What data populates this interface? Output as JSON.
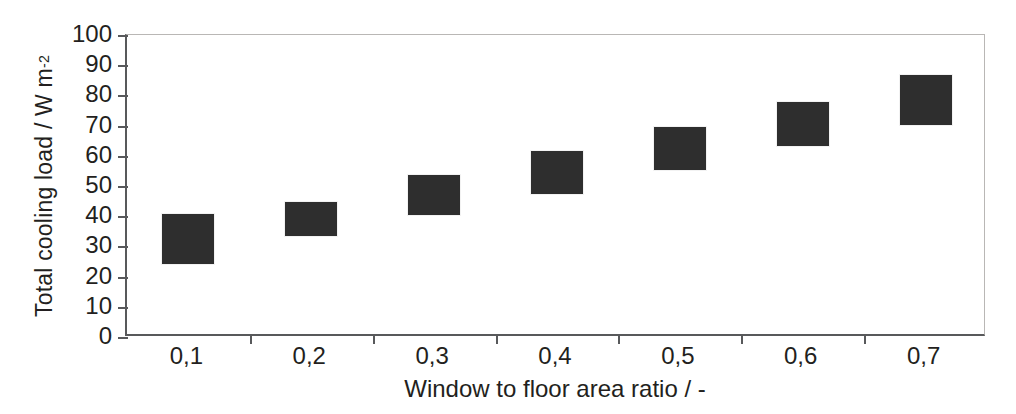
{
  "chart_data": {
    "type": "bar",
    "title": "",
    "xlabel": "Window to floor area ratio / -",
    "ylabel_text": "Total cooling load / W m",
    "ylabel_exponent": "-2",
    "ylabel_full": "Total cooling load / W m-2",
    "categories": [
      "0,1",
      "0,2",
      "0,3",
      "0,4",
      "0,5",
      "0,6",
      "0,7"
    ],
    "x_values": [
      0.1,
      0.2,
      0.3,
      0.4,
      0.5,
      0.6,
      0.7
    ],
    "values": [
      32,
      39,
      47,
      54,
      62,
      70,
      79
    ],
    "ranges": [
      {
        "category": "0,1",
        "low": 24,
        "high": 41
      },
      {
        "category": "0,2",
        "low": 33,
        "high": 45
      },
      {
        "category": "0,3",
        "low": 40,
        "high": 54
      },
      {
        "category": "0,4",
        "low": 47,
        "high": 62
      },
      {
        "category": "0,5",
        "low": 55,
        "high": 70
      },
      {
        "category": "0,6",
        "low": 63,
        "high": 78
      },
      {
        "category": "0,7",
        "low": 70,
        "high": 87
      }
    ],
    "ylim": [
      0,
      100
    ],
    "ytick_values": [
      0,
      10,
      20,
      30,
      40,
      50,
      60,
      70,
      80,
      90,
      100
    ],
    "ytick_labels": [
      "0",
      "10",
      "20",
      "30",
      "40",
      "50",
      "60",
      "70",
      "80",
      "90",
      "100"
    ],
    "grid": false,
    "legend": null,
    "marker_color": "#2e2e2e",
    "axis_color": "#58595b",
    "frame_color": "#b9b7b5",
    "background": "#ffffff"
  }
}
